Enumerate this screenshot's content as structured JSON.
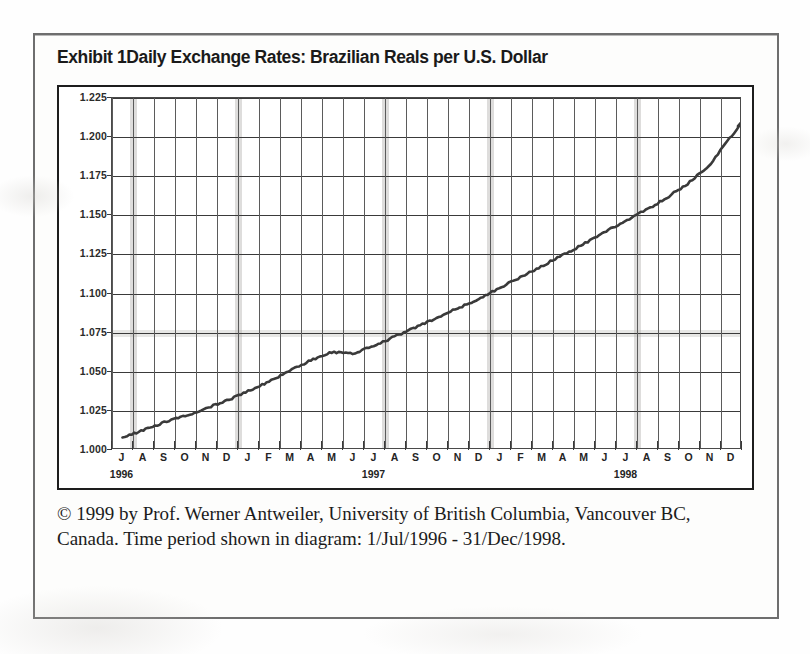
{
  "exhibit": {
    "title": "Exhibit 1Daily Exchange Rates: Brazilian Reals per U.S. Dollar",
    "caption": "© 1999 by Prof. Werner Antweiler, University of British Columbia, Vancouver BC, Canada. Time period shown in diagram: 1/Jul/1996 - 31/Dec/1998."
  },
  "chart_data": {
    "type": "line",
    "title": "Daily Exchange Rates: Brazilian Reals per U.S. Dollar",
    "xlabel": "",
    "ylabel": "",
    "ylim": [
      1.0,
      1.225
    ],
    "ytick_labels": [
      "1.225",
      "1.200",
      "1.175",
      "1.150",
      "1.125",
      "1.100",
      "1.075",
      "1.050",
      "1.025",
      "1.000"
    ],
    "ytick_values": [
      1.225,
      1.2,
      1.175,
      1.15,
      1.125,
      1.1,
      1.075,
      1.05,
      1.025,
      1.0
    ],
    "grid": true,
    "legend": "none",
    "x_month_labels": [
      "J",
      "A",
      "S",
      "O",
      "N",
      "D",
      "J",
      "F",
      "M",
      "A",
      "M",
      "J",
      "J",
      "A",
      "S",
      "O",
      "N",
      "D",
      "J",
      "F",
      "M",
      "A",
      "M",
      "J",
      "J",
      "A",
      "S",
      "O",
      "N",
      "D"
    ],
    "x_year_labels": [
      "1996",
      "1997",
      "1998"
    ],
    "x_year_positions": [
      0.5,
      12.5,
      24.5
    ],
    "x_range_start": "1/Jul/1996",
    "x_range_end": "31/Dec/1998",
    "series": [
      {
        "name": "BRL per USD",
        "color": "#3a3a3a",
        "x": [
          "1996-07",
          "1996-08",
          "1996-09",
          "1996-10",
          "1996-11",
          "1996-12",
          "1997-01",
          "1997-02",
          "1997-03",
          "1997-04",
          "1997-05",
          "1997-06",
          "1997-07",
          "1997-08",
          "1997-09",
          "1997-10",
          "1997-11",
          "1997-12",
          "1998-01",
          "1998-02",
          "1998-03",
          "1998-04",
          "1998-05",
          "1998-06",
          "1998-07",
          "1998-08",
          "1998-09",
          "1998-10",
          "1998-11",
          "1998-12"
        ],
        "values": [
          1.007,
          1.012,
          1.017,
          1.021,
          1.026,
          1.031,
          1.037,
          1.043,
          1.05,
          1.057,
          1.062,
          1.061,
          1.066,
          1.072,
          1.078,
          1.084,
          1.09,
          1.096,
          1.103,
          1.11,
          1.117,
          1.124,
          1.131,
          1.139,
          1.146,
          1.153,
          1.161,
          1.17,
          1.181,
          1.199
        ]
      }
    ]
  }
}
